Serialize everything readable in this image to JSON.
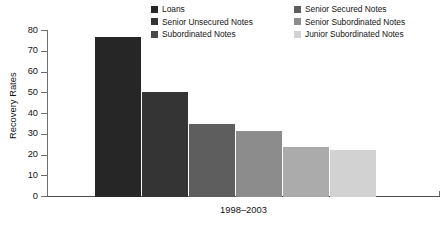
{
  "chart_data": {
    "type": "bar",
    "title": "",
    "subtitle": "",
    "xlabel": "1998–2003",
    "ylabel": "Recovery Rates",
    "ylim": [
      0,
      80
    ],
    "ytick_step": 10,
    "ytick_labels": [
      "80",
      "70",
      "60",
      "50",
      "40",
      "30",
      "20",
      "10",
      "0"
    ],
    "ytick_values": [
      80,
      70,
      60,
      50,
      40,
      30,
      20,
      10,
      0
    ],
    "grid": false,
    "legend_position": "top",
    "legend_columns": 2,
    "categories": [
      "Loans",
      "Senior Secured Notes",
      "Senior Unsecured Notes",
      "Senior Subordinated Notes",
      "Subordinated Notes",
      "Junior Subordinated Notes"
    ],
    "values": [
      77,
      50.5,
      35,
      32,
      24,
      22.5
    ],
    "colors": [
      "#262626",
      "#343434",
      "#5e5e5e",
      "#8c8c8c",
      "#ababab",
      "#d2d2d2"
    ],
    "series": [
      {
        "name": "1998–2003",
        "values": [
          77,
          50.5,
          35,
          32,
          24,
          22.5
        ]
      }
    ]
  },
  "legend": {
    "entries": [
      {
        "label": "Loans",
        "color": "#262626"
      },
      {
        "label": "Senior Secured Notes",
        "color": "#5e5e5e"
      },
      {
        "label": "Senior Unsecured Notes",
        "color": "#343434"
      },
      {
        "label": "Senior Subordinated Notes",
        "color": "#8c8c8c"
      },
      {
        "label": "Subordinated Notes",
        "color": "#4a4a4a"
      },
      {
        "label": "Junior Subordinated Notes",
        "color": "#d2d2d2"
      }
    ]
  },
  "axes": {
    "y_title": "Recovery Rates",
    "x_group_label": "1998–2003",
    "y_ticks": [
      "80",
      "70",
      "60",
      "50",
      "40",
      "30",
      "20",
      "10",
      "0"
    ]
  }
}
